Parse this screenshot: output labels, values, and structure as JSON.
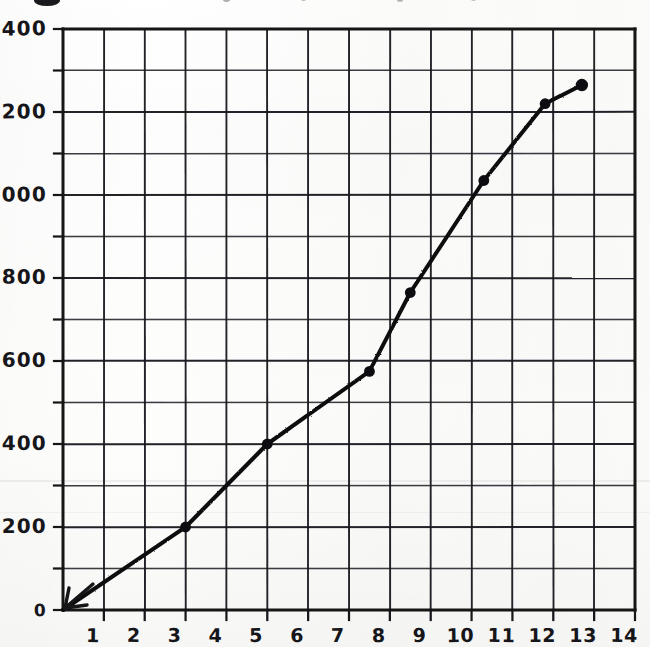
{
  "page": {
    "media": "scanned hand-drawn graph paper",
    "ink_color": "#16161a",
    "paper_color": "#fbfbf9"
  },
  "chart_data": {
    "type": "line",
    "title": "",
    "subtitle": "",
    "xlabel": "",
    "ylabel": "",
    "xlim": [
      0,
      14
    ],
    "ylim": [
      0,
      1400
    ],
    "grid": true,
    "legend": null,
    "x_ticks": [
      1,
      2,
      3,
      4,
      5,
      6,
      7,
      8,
      9,
      10,
      11,
      12,
      13,
      14
    ],
    "x_tick_labels": [
      "1",
      "2",
      "3",
      "4",
      "5",
      "6",
      "7",
      "8",
      "9",
      "10",
      "11",
      "12",
      "13",
      "14"
    ],
    "y_ticks": [
      0,
      200,
      400,
      600,
      800,
      1000,
      1200,
      1400
    ],
    "y_tick_labels": [
      "0",
      "200",
      "400",
      "600",
      "800",
      "1000",
      "1200",
      "1400"
    ],
    "y_minor_step": 100,
    "x_minor_step": 1,
    "series": [
      {
        "name": "curve",
        "marker": "filled-circle",
        "line_width_px": 4,
        "points": [
          {
            "x": 0.0,
            "y": 0,
            "marker": false
          },
          {
            "x": 3.0,
            "y": 200,
            "marker": true
          },
          {
            "x": 5.0,
            "y": 400,
            "marker": true
          },
          {
            "x": 7.5,
            "y": 575,
            "marker": true
          },
          {
            "x": 8.5,
            "y": 765,
            "marker": true
          },
          {
            "x": 10.3,
            "y": 1035,
            "marker": true
          },
          {
            "x": 11.8,
            "y": 1220,
            "marker": true
          },
          {
            "x": 12.7,
            "y": 1265,
            "marker": true
          }
        ]
      }
    ]
  }
}
